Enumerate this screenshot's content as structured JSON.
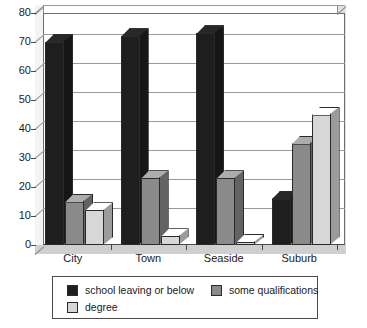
{
  "chart_data": {
    "type": "bar",
    "title": "",
    "xlabel": "",
    "ylabel": "",
    "categories": [
      "City",
      "Town",
      "Seaside",
      "Suburb"
    ],
    "ylim": [
      0,
      80
    ],
    "yticks": [
      0,
      10,
      20,
      30,
      40,
      50,
      60,
      70,
      80
    ],
    "grid": true,
    "legend_position": "bottom",
    "series": [
      {
        "name": "school leaving or below",
        "color": "#1e1e1e",
        "values": [
          70,
          72,
          73,
          16
        ]
      },
      {
        "name": "some qualifications",
        "color": "#8a8a8a",
        "values": [
          15,
          23,
          23,
          35
        ]
      },
      {
        "name": "degree",
        "color": "#d7d7d7",
        "values": [
          12,
          3,
          1,
          45
        ]
      }
    ]
  },
  "axis": {
    "y_tick_labels": [
      "80",
      "70",
      "60",
      "50",
      "40",
      "30",
      "20",
      "10",
      "0"
    ],
    "x_tick_labels": [
      "City",
      "Town",
      "Seaside",
      "Suburb"
    ]
  },
  "legend": {
    "items": [
      {
        "label": "school leaving or below",
        "swatch_color": "#1e1e1e"
      },
      {
        "label": "some qualifications",
        "swatch_color": "#8a8a8a"
      },
      {
        "label": "degree",
        "swatch_color": "#d7d7d7"
      }
    ]
  },
  "colors": {
    "series_dark": "#1e1e1e",
    "series_medium": "#8a8a8a",
    "series_light": "#d7d7d7",
    "plot_background": "#ffffff",
    "gridline": "#9a9a9a",
    "axis_line": "#4a4a4a",
    "floor": "#cfcfcf",
    "right_wall": "#e2e2e2",
    "left_wall": "#f4f4f4"
  }
}
